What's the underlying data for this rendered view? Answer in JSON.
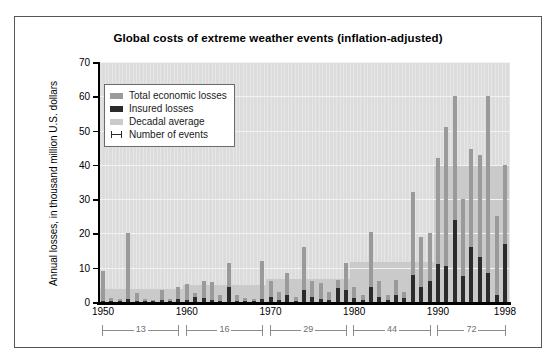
{
  "figure": {
    "title": "Global costs of extreme weather events (inflation-adjusted)"
  },
  "legend": {
    "items": [
      {
        "label": "Total economic losses",
        "color": "#9a9a9a",
        "marker": "swatch"
      },
      {
        "label": "Insured losses",
        "color": "#2b2b2b",
        "marker": "swatch"
      },
      {
        "label": "Decadal average",
        "color": "#cacaca",
        "marker": "swatch"
      },
      {
        "label": "Number of events",
        "color": "#2b2b2b",
        "marker": "error-bar"
      }
    ]
  },
  "axes": {
    "ylabel": "Annual losses, in thousand million U.S. dollars",
    "yticks": [
      0,
      10,
      20,
      30,
      40,
      50,
      60,
      70
    ],
    "ylim": [
      0,
      70
    ],
    "xticks": [
      1950,
      1960,
      1970,
      1980,
      1990,
      1998
    ],
    "xlim": [
      1949.4,
      1998.6
    ]
  },
  "event_brackets": [
    {
      "label": "13",
      "start": 1950,
      "end": 1959
    },
    {
      "label": "16",
      "start": 1960,
      "end": 1969
    },
    {
      "label": "29",
      "start": 1970,
      "end": 1979
    },
    {
      "label": "44",
      "start": 1980,
      "end": 1989
    },
    {
      "label": "72",
      "start": 1990,
      "end": 1998
    }
  ],
  "chart_data": {
    "type": "bar",
    "title": "Global costs of extreme weather events (inflation-adjusted)",
    "xlabel": "",
    "ylabel": "Annual losses, in thousand million U.S. dollars",
    "ylim": [
      0,
      70
    ],
    "yticks": [
      0,
      10,
      20,
      30,
      40,
      50,
      60,
      70
    ],
    "grid": true,
    "legend_position": "upper-left-inside",
    "x": [
      1950,
      1951,
      1952,
      1953,
      1954,
      1955,
      1956,
      1957,
      1958,
      1959,
      1960,
      1961,
      1962,
      1963,
      1964,
      1965,
      1966,
      1967,
      1968,
      1969,
      1970,
      1971,
      1972,
      1973,
      1974,
      1975,
      1976,
      1977,
      1978,
      1979,
      1980,
      1981,
      1982,
      1983,
      1984,
      1985,
      1986,
      1987,
      1988,
      1989,
      1990,
      1991,
      1992,
      1993,
      1994,
      1995,
      1996,
      1997,
      1998
    ],
    "series": [
      {
        "name": "Total economic losses",
        "color": "#9a9a9a",
        "values": [
          9.0,
          1.2,
          1.0,
          20.0,
          2.5,
          1.0,
          0.6,
          3.5,
          1.0,
          4.5,
          5.4,
          2.5,
          6.0,
          5.8,
          2.0,
          11.5,
          2.0,
          1.2,
          1.0,
          12.0,
          6.0,
          3.0,
          8.5,
          1.5,
          16.0,
          6.0,
          5.5,
          3.0,
          6.5,
          11.5,
          4.5,
          2.0,
          20.5,
          6.0,
          2.0,
          6.5,
          3.0,
          32.0,
          19.0,
          20.0,
          42.0,
          51.0,
          60.0,
          30.0,
          44.5,
          43.0,
          60.0,
          25.0,
          40.0
        ]
      },
      {
        "name": "Insured losses",
        "color": "#2b2b2b",
        "values": [
          0.3,
          0.2,
          0.1,
          0.8,
          0.2,
          0.1,
          0.1,
          0.5,
          0.2,
          0.8,
          0.6,
          1.5,
          1.2,
          0.6,
          0.3,
          4.5,
          0.3,
          0.2,
          0.2,
          1.0,
          1.5,
          0.5,
          2.0,
          0.4,
          3.5,
          1.5,
          1.0,
          0.6,
          4.0,
          3.5,
          1.2,
          0.5,
          4.5,
          1.5,
          0.6,
          2.0,
          1.2,
          8.0,
          4.5,
          6.0,
          11.0,
          10.5,
          24.0,
          7.5,
          16.0,
          13.0,
          8.5,
          2.0,
          17.0
        ]
      }
    ],
    "decadal_average": [
      {
        "decade": "1950s",
        "start": 1950,
        "end": 1959,
        "value": 3.9
      },
      {
        "decade": "1960s",
        "start": 1960,
        "end": 1969,
        "value": 5.1
      },
      {
        "decade": "1970s",
        "start": 1970,
        "end": 1979,
        "value": 6.8
      },
      {
        "decade": "1980s",
        "start": 1980,
        "end": 1989,
        "value": 11.8
      },
      {
        "decade": "1990s",
        "start": 1990,
        "end": 1998,
        "value": 40.0
      }
    ],
    "number_of_events": [
      {
        "decade": "1950s",
        "count": 13
      },
      {
        "decade": "1960s",
        "count": 16
      },
      {
        "decade": "1970s",
        "count": 29
      },
      {
        "decade": "1980s",
        "count": 44
      },
      {
        "decade": "1990s",
        "count": 72
      }
    ]
  }
}
